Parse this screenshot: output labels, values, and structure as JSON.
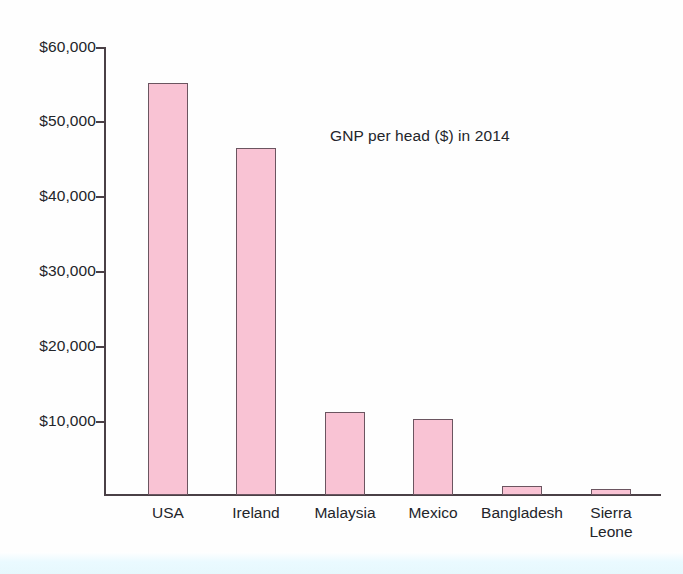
{
  "chart_data": {
    "type": "bar",
    "title": "GNP per head ($) in 2014",
    "xlabel": "",
    "ylabel": "",
    "categories": [
      "USA",
      "Ireland",
      "Malaysia",
      "Mexico",
      "Bangladesh",
      "Sierra Leone"
    ],
    "values": [
      55200,
      46500,
      11100,
      10200,
      1200,
      800
    ],
    "ylim": [
      0,
      60000
    ],
    "ytick_labels": [
      "$60,000",
      "$50,000",
      "$40,000",
      "$30,000",
      "$20,000",
      "$10,000"
    ],
    "ytick_values": [
      60000,
      50000,
      40000,
      30000,
      20000,
      10000
    ],
    "grid": false,
    "legend": null,
    "bar_color": "#f9c3d4",
    "bar_border_color": "#6b5560",
    "axis_color": "#4a4046",
    "text_color": "#23252a"
  },
  "axis": {
    "y_ticks": [
      {
        "label": "$60,000"
      },
      {
        "label": "$50,000"
      },
      {
        "label": "$40,000"
      },
      {
        "label": "$30,000"
      },
      {
        "label": "$20,000"
      },
      {
        "label": "$10,000"
      }
    ],
    "x_labels": [
      {
        "label": "USA"
      },
      {
        "label": "Ireland"
      },
      {
        "label": "Malaysia"
      },
      {
        "label": "Mexico"
      },
      {
        "label": "Bangladesh"
      },
      {
        "label": "Sierra\nLeone"
      }
    ]
  }
}
